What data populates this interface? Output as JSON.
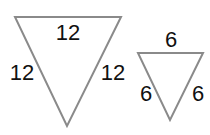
{
  "diagram": {
    "stroke_color": "#8a8a8a",
    "large_triangle": {
      "top_label": "12",
      "left_label": "12",
      "right_label": "12"
    },
    "small_triangle": {
      "top_label": "6",
      "left_label": "6",
      "right_label": "6"
    }
  }
}
